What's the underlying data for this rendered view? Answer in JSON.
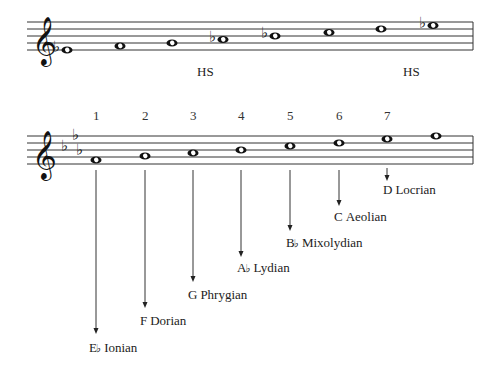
{
  "diagram": {
    "staff1": {
      "clef": "treble",
      "notes": [
        {
          "name": "Eb4",
          "x": 67,
          "y": 50,
          "flat": true
        },
        {
          "name": "F4",
          "x": 120,
          "y": 46,
          "flat": false
        },
        {
          "name": "G4",
          "x": 172,
          "y": 43,
          "flat": false
        },
        {
          "name": "Ab4",
          "x": 223,
          "y": 39.5,
          "flat": true
        },
        {
          "name": "Bb4",
          "x": 275,
          "y": 36,
          "flat": true
        },
        {
          "name": "C5",
          "x": 329,
          "y": 32.5,
          "flat": false
        },
        {
          "name": "D5",
          "x": 381,
          "y": 29,
          "flat": false
        },
        {
          "name": "Eb5",
          "x": 433,
          "y": 25.5,
          "flat": true
        }
      ],
      "markers": [
        {
          "text": "HS",
          "x": 197,
          "y": 76
        },
        {
          "text": "HS",
          "x": 403,
          "y": 76
        }
      ]
    },
    "staff2": {
      "clef": "treble",
      "key_signature": "Eb major (3 flats)",
      "degree_numbers": [
        "1",
        "2",
        "3",
        "4",
        "5",
        "6",
        "7"
      ],
      "notes": [
        {
          "name": "Eb4",
          "x": 96,
          "y": 160
        },
        {
          "name": "F4",
          "x": 145,
          "y": 156
        },
        {
          "name": "G4",
          "x": 193,
          "y": 153
        },
        {
          "name": "Ab4",
          "x": 241,
          "y": 150
        },
        {
          "name": "Bb4",
          "x": 290,
          "y": 146
        },
        {
          "name": "C5",
          "x": 339,
          "y": 143
        },
        {
          "name": "D5",
          "x": 387,
          "y": 139
        },
        {
          "name": "Eb5",
          "x": 436,
          "y": 136
        }
      ]
    },
    "modes": [
      {
        "degree": "1",
        "root": "E",
        "accidental": "♭",
        "name": "Ionian",
        "x": 96,
        "arrow_end": 334,
        "label_x": 89,
        "label_y": 352
      },
      {
        "degree": "2",
        "root": "F",
        "accidental": "",
        "name": "Dorian",
        "x": 145,
        "arrow_end": 308,
        "label_x": 140,
        "label_y": 325
      },
      {
        "degree": "3",
        "root": "G",
        "accidental": "",
        "name": "Phrygian",
        "x": 193,
        "arrow_end": 282,
        "label_x": 188,
        "label_y": 299
      },
      {
        "degree": "4",
        "root": "A",
        "accidental": "♭",
        "name": "Lydian",
        "x": 241,
        "arrow_end": 257,
        "label_x": 237,
        "label_y": 272
      },
      {
        "degree": "5",
        "root": "B",
        "accidental": "♭",
        "name": "Mixolydian",
        "x": 290,
        "arrow_end": 231,
        "label_x": 286,
        "label_y": 247
      },
      {
        "degree": "6",
        "root": "C",
        "accidental": "",
        "name": "Aeolian",
        "x": 339,
        "arrow_end": 206,
        "label_x": 334,
        "label_y": 221
      },
      {
        "degree": "7",
        "root": "D",
        "accidental": "",
        "name": "Locrian",
        "x": 387,
        "arrow_end": 181,
        "label_x": 383,
        "label_y": 194
      }
    ]
  }
}
